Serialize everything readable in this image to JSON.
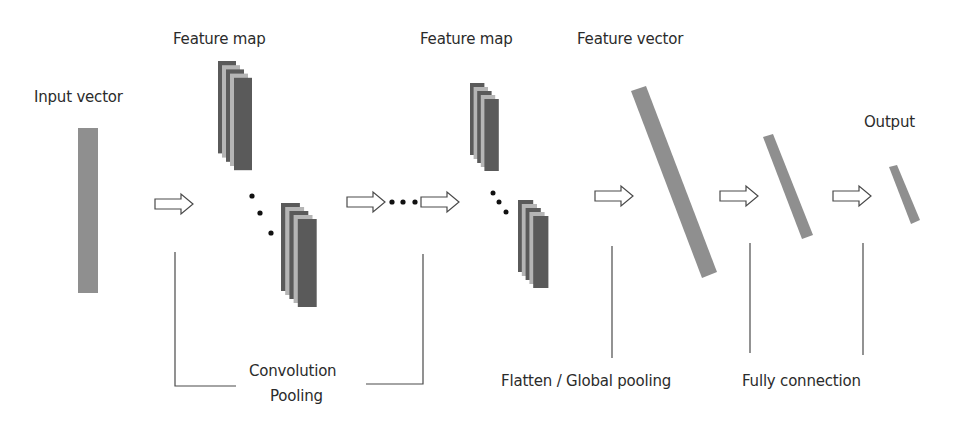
{
  "diagram": {
    "labels": {
      "input_vector": "Input vector",
      "feature_map_1": "Feature map",
      "feature_map_2": "Feature map",
      "feature_vector": "Feature vector",
      "output": "Output",
      "convolution": "Convolution",
      "pooling": "Pooling",
      "flatten": "Flatten / Global pooling",
      "fully_connection": "Fully connection"
    },
    "colors": {
      "vector_fill": "#8f8f8f",
      "map_dark": "#5a5a5a",
      "map_light": "#b5b5b5",
      "line": "#4a4a4a",
      "text": "#2b2b2b"
    },
    "stages": [
      {
        "name": "Input vector",
        "type": "vector"
      },
      {
        "name": "Convolution / Pooling",
        "type": "feature-map-stack",
        "repeat": "..."
      },
      {
        "name": "Feature map",
        "type": "feature-map-stack"
      },
      {
        "name": "Flatten / Global pooling",
        "type": "feature-vector"
      },
      {
        "name": "Fully connection",
        "type": "dense-vector"
      },
      {
        "name": "Output",
        "type": "output-vector"
      }
    ]
  }
}
